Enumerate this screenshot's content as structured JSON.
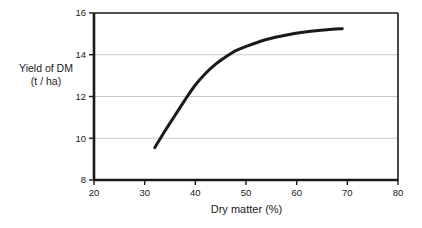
{
  "chart_data": {
    "type": "line",
    "title": "",
    "xlabel": "Dry matter (%)",
    "ylabel_line1": "Yield of DM",
    "ylabel_line2": "(t / ha)",
    "xlim": [
      20,
      80
    ],
    "ylim": [
      8,
      16
    ],
    "xticks": [
      20,
      30,
      40,
      50,
      60,
      70,
      80
    ],
    "xtick_labels": [
      "20",
      "30",
      "40",
      "50",
      "60",
      "70",
      "80"
    ],
    "yticks": [
      8,
      10,
      12,
      14,
      16
    ],
    "ytick_labels": [
      "8",
      "10",
      "12",
      "14",
      "16"
    ],
    "grid": "horizontal",
    "grid_color": "#c8c8c8",
    "axis_color": "#1a1a1a",
    "line_color": "#1a1a1a",
    "line_width": 3,
    "legend": "none",
    "series": [
      {
        "name": "Yield of DM",
        "x": [
          32.0,
          34.0,
          36.0,
          38.0,
          40.0,
          42.0,
          44.0,
          46.0,
          48.0,
          50.0,
          54.0,
          58.0,
          62.0,
          66.0,
          69.0
        ],
        "y": [
          9.55,
          10.35,
          11.1,
          11.85,
          12.55,
          13.1,
          13.55,
          13.9,
          14.2,
          14.4,
          14.73,
          14.95,
          15.1,
          15.2,
          15.25
        ]
      }
    ]
  }
}
